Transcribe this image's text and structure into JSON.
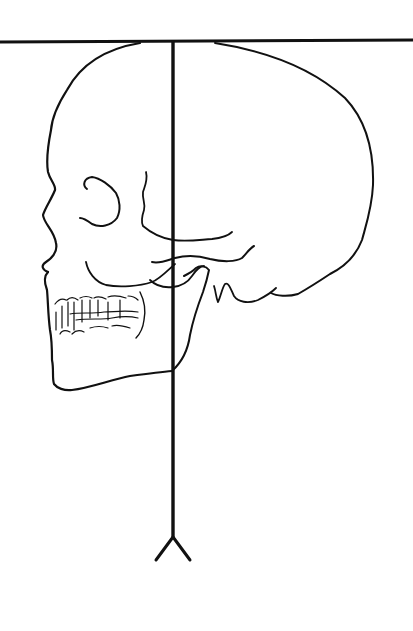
{
  "figure": {
    "title": "Skull in lateral view with reference lines",
    "elements": [
      {
        "name": "horizontal-reference-line",
        "description": "Horizontal line tangent to top of cranium"
      },
      {
        "name": "vertical-axis-line",
        "description": "Vertical line from top of skull downward ending in inverted-V"
      },
      {
        "name": "skull-outline",
        "description": "Outline of cranium, face and mandible"
      },
      {
        "name": "orbit",
        "description": "Eye socket contour"
      },
      {
        "name": "zygomatic-arch",
        "description": "Cheekbone arch"
      },
      {
        "name": "teeth",
        "description": "Upper and lower dentition"
      },
      {
        "name": "mastoid-process",
        "description": "Mastoid / occipital base contour"
      }
    ],
    "colors": {
      "stroke": "#111111",
      "background": "#ffffff"
    }
  }
}
